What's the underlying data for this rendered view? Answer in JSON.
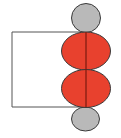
{
  "diagram": {
    "colors": {
      "background": "#ffffff",
      "red_lobe": "#e8412e",
      "gray_lobe": "#b9b9b9",
      "outline": "#3a3a3a",
      "axis_line": "#7a1a10",
      "bracket": "#555555"
    },
    "shapes": {
      "top_gray": {
        "cx": 86,
        "cy": 18,
        "rx": 14.5,
        "ry": 14.5
      },
      "red_upper": {
        "cx": 86,
        "cy": 51,
        "rx": 24.5,
        "ry": 19
      },
      "red_lower": {
        "cx": 86,
        "cy": 88.5,
        "rx": 24.5,
        "ry": 19
      },
      "bottom_gray": {
        "cx": 85.5,
        "cy": 119,
        "rx": 14,
        "ry": 12
      },
      "axis": {
        "x": 86,
        "y1": 32,
        "y2": 107
      },
      "bracket": {
        "x": 12,
        "y1": 32,
        "y2": 107
      }
    }
  }
}
